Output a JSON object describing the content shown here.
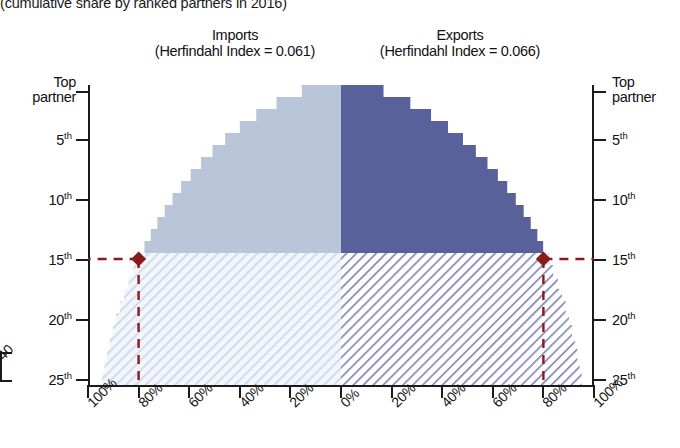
{
  "suptitle": "(cumulative share by ranked partners in 2016)",
  "panels": {
    "imports": {
      "name": "Imports",
      "index_label": "(Herfindahl Index = 0.061)",
      "index_value": 0.061
    },
    "exports": {
      "name": "Exports",
      "index_label": "(Herfindahl Index = 0.066)",
      "index_value": 0.066
    }
  },
  "axes": {
    "y_left": {
      "top_label_line1": "Top",
      "top_label_line2": "partner",
      "ticks": [
        "5",
        "10",
        "15",
        "20",
        "25"
      ],
      "suffix": "th"
    },
    "y_right": {
      "top_label_line1": "Top",
      "top_label_line2": "partner",
      "ticks": [
        "5",
        "10",
        "15",
        "20",
        "25"
      ],
      "suffix": "th"
    },
    "x_left": [
      "100%",
      "80%",
      "60%",
      "40%",
      "20%",
      "0%"
    ],
    "x_right": [
      "0%",
      "20%",
      "40%",
      "60%",
      "80%",
      "100%"
    ],
    "edge_stub": "40"
  },
  "colors": {
    "imports_solid": "#b9c6da",
    "imports_hatch_bg": "#f2f5fa",
    "imports_hatch_line": "#c9d5e6",
    "exports_solid": "#58619a",
    "exports_hatch_bg": "#ffffff",
    "exports_hatch_line": "#7a82ae",
    "marker": "#8b1a1a",
    "axis": "#1b1b1b"
  },
  "markers": {
    "imports": {
      "rank": 15,
      "share_pct": 80,
      "label": "15th partner at 80%"
    },
    "exports": {
      "rank": 15,
      "share_pct": 80,
      "label": "15th partner at 80%"
    }
  },
  "chart_data": {
    "type": "area",
    "title": "(cumulative share by ranked partners in 2016)",
    "subtitle": "Mirrored cumulative share step chart: Imports (left) vs Exports (right)",
    "xlabel": "Cumulative share of trade (%)",
    "ylabel": "Partner rank",
    "xlim": [
      -100,
      100
    ],
    "ylim": [
      1,
      25
    ],
    "grid": false,
    "legend_position": "none",
    "orientation": "horizontal-mirrored",
    "ranks": [
      1,
      2,
      3,
      4,
      5,
      6,
      7,
      8,
      9,
      10,
      11,
      12,
      13,
      14,
      15,
      16,
      17,
      18,
      19,
      20,
      21,
      22,
      23,
      24,
      25
    ],
    "series": [
      {
        "name": "Imports",
        "side": "left",
        "herfindahl_index": 0.061,
        "values": [
          15.5,
          25.5,
          33.5,
          40.0,
          45.8,
          50.8,
          55.3,
          59.4,
          63.2,
          66.6,
          69.7,
          72.6,
          75.2,
          77.7,
          80.0,
          82.1,
          84.0,
          85.8,
          87.4,
          88.9,
          90.2,
          91.4,
          92.5,
          93.5,
          94.4
        ]
      },
      {
        "name": "Exports",
        "side": "right",
        "herfindahl_index": 0.066,
        "values": [
          16.8,
          27.4,
          35.6,
          42.3,
          48.2,
          53.3,
          57.9,
          62.0,
          65.7,
          69.1,
          72.2,
          75.0,
          77.6,
          79.9,
          82.0,
          83.9,
          85.7,
          87.3,
          88.8,
          90.1,
          91.3,
          92.4,
          93.4,
          94.3,
          95.1
        ]
      }
    ],
    "annotations": [
      {
        "series": "Imports",
        "rank": 15,
        "value": 80,
        "marker": "diamond",
        "guide": "dashed"
      },
      {
        "series": "Exports",
        "rank": 15,
        "value": 80,
        "marker": "diamond",
        "guide": "dashed"
      }
    ]
  }
}
